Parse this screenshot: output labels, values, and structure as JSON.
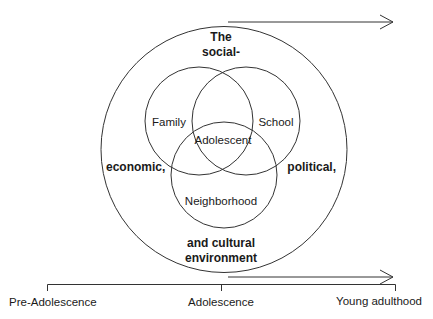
{
  "diagram": {
    "environment_label_lines": [
      "The",
      "social-",
      "economic,",
      "political,",
      "and cultural",
      "environment"
    ],
    "circles": {
      "family": "Family",
      "school": "School",
      "neighborhood": "Neighborhood",
      "center": "Adolescent"
    },
    "timeline": {
      "stages": [
        "Pre-Adolescence",
        "Adolescence",
        "Young adulthood"
      ]
    },
    "colors": {
      "stroke": "#333333",
      "text": "#1a1a1a",
      "background": "#ffffff"
    }
  }
}
